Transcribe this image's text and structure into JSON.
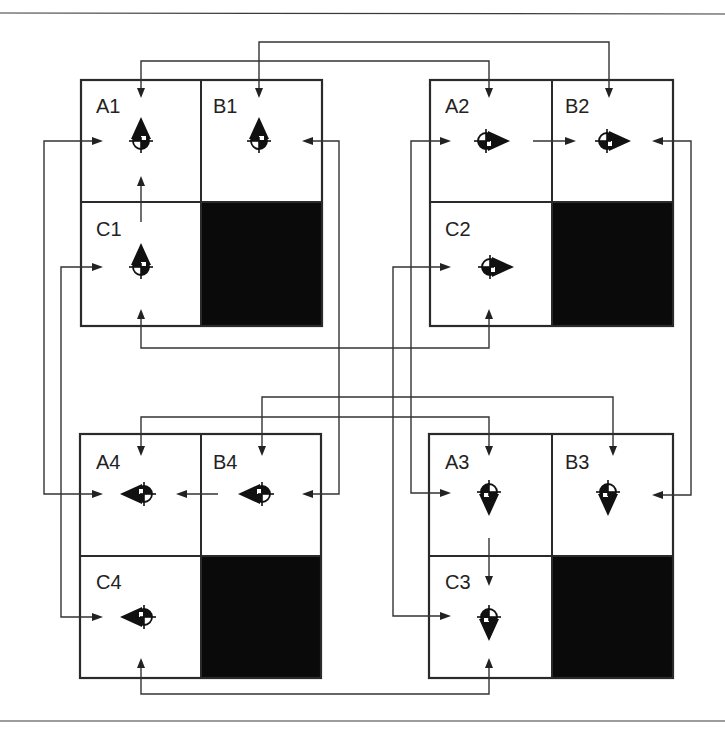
{
  "figure": {
    "blocks": [
      {
        "id": "1",
        "heading": "up",
        "cells": [
          {
            "label": "A1"
          },
          {
            "label": "B1"
          },
          {
            "label": "C1"
          }
        ],
        "blocked_cell": "bottom-right"
      },
      {
        "id": "2",
        "heading": "right",
        "cells": [
          {
            "label": "A2"
          },
          {
            "label": "B2"
          },
          {
            "label": "C2"
          }
        ],
        "blocked_cell": "bottom-right"
      },
      {
        "id": "3",
        "heading": "down",
        "cells": [
          {
            "label": "A3"
          },
          {
            "label": "B3"
          },
          {
            "label": "C3"
          }
        ],
        "blocked_cell": "bottom-right"
      },
      {
        "id": "4",
        "heading": "left",
        "cells": [
          {
            "label": "A4"
          },
          {
            "label": "B4"
          },
          {
            "label": "C4"
          }
        ],
        "blocked_cell": "bottom-right"
      }
    ],
    "connections": [
      {
        "from": "A1",
        "to": "A2"
      },
      {
        "from": "B1",
        "to": "B2"
      },
      {
        "from": "C1",
        "to": "C2"
      },
      {
        "from": "A4",
        "to": "A3"
      },
      {
        "from": "B4",
        "to": "B3"
      },
      {
        "from": "C4",
        "to": "C3"
      },
      {
        "from": "A1",
        "to": "A4"
      },
      {
        "from": "C1",
        "to": "C4"
      },
      {
        "from": "B1",
        "to": "B4"
      },
      {
        "from": "A2",
        "to": "A3"
      },
      {
        "from": "C2",
        "to": "C3"
      },
      {
        "from": "B2",
        "to": "B3"
      },
      {
        "from": "C1",
        "to": "A1"
      },
      {
        "from": "A2",
        "to": "B2"
      },
      {
        "from": "A3",
        "to": "C3"
      },
      {
        "from": "B4",
        "to": "A4"
      }
    ],
    "colors": {
      "line": "#333333",
      "blocked": "#0a0a0a",
      "background": "#ffffff"
    }
  }
}
